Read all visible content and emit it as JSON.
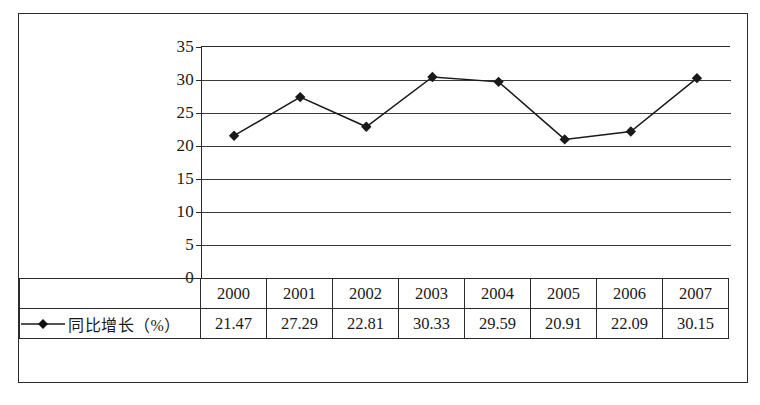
{
  "chart_data": {
    "type": "line",
    "title": "",
    "subtitle": "",
    "xlabel": "",
    "ylabel": "",
    "categories": [
      "2000",
      "2001",
      "2002",
      "2003",
      "2004",
      "2005",
      "2006",
      "2007"
    ],
    "series": [
      {
        "name": "同比增长（%）",
        "values": [
          21.47,
          27.29,
          22.81,
          30.33,
          29.59,
          20.91,
          22.09,
          30.15
        ],
        "marker": "diamond",
        "color": "#1a1a1a"
      }
    ],
    "ylim": [
      0,
      35
    ],
    "ytick_labels": [
      "0",
      "5",
      "10",
      "15",
      "20",
      "25",
      "30",
      "35"
    ],
    "ytick_values": [
      0,
      5,
      10,
      15,
      20,
      25,
      30,
      35
    ],
    "grid": true,
    "grid_axis": "y",
    "legend_position": "table-left"
  },
  "table": {
    "legend_label": "同比增长（%）",
    "legend_marker_icon": "line-diamond-marker-icon",
    "header": [
      "2000",
      "2001",
      "2002",
      "2003",
      "2004",
      "2005",
      "2006",
      "2007"
    ],
    "values": [
      "21.47",
      "27.29",
      "22.81",
      "30.33",
      "29.59",
      "20.91",
      "22.09",
      "30.15"
    ]
  },
  "axis": {
    "y_labels": [
      "35",
      "30",
      "25",
      "20",
      "15",
      "10",
      "5",
      "0"
    ]
  },
  "colors": {
    "line": "#1a1a1a",
    "grid": "#3a3a3a",
    "border": "#2b2b2b",
    "background": "#ffffff"
  }
}
